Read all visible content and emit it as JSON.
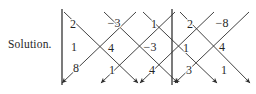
{
  "figure": {
    "label": "Solution.",
    "caption_text": "Solution.",
    "background_color": "#ffffff",
    "ink_color": "#1f1f1f"
  },
  "determinant": {
    "left_bar_label": "|",
    "right_bar_label": "|",
    "rows": [
      [
        "2",
        "−3",
        "1"
      ],
      [
        "1",
        "4",
        "−3"
      ],
      [
        "8",
        "1",
        "4"
      ]
    ],
    "repeated_columns": [
      [
        "2",
        "−8"
      ],
      [
        "1",
        "4"
      ],
      [
        "3",
        "1"
      ]
    ]
  },
  "entries": [
    {
      "name": "entry-r1c1",
      "text": "2",
      "x": 73,
      "y": 24
    },
    {
      "name": "entry-r1c2",
      "text": "−3",
      "x": 114,
      "y": 23
    },
    {
      "name": "entry-r1c3",
      "text": "1",
      "x": 154,
      "y": 24
    },
    {
      "name": "entry-r1c4",
      "text": "2",
      "x": 190,
      "y": 24
    },
    {
      "name": "entry-r1c5",
      "text": "−8",
      "x": 222,
      "y": 23
    },
    {
      "name": "entry-r2c1",
      "text": "1",
      "x": 74,
      "y": 47
    },
    {
      "name": "entry-r2c2",
      "text": "4",
      "x": 111,
      "y": 48
    },
    {
      "name": "entry-r2c3",
      "text": "−3",
      "x": 150,
      "y": 47
    },
    {
      "name": "entry-r2c4",
      "text": "1",
      "x": 186,
      "y": 48
    },
    {
      "name": "entry-r2c5",
      "text": "4",
      "x": 222,
      "y": 47
    },
    {
      "name": "entry-r3c1",
      "text": "8",
      "x": 76,
      "y": 68
    },
    {
      "name": "entry-r3c2",
      "text": "1",
      "x": 112,
      "y": 70
    },
    {
      "name": "entry-r3c3",
      "text": "4",
      "x": 152,
      "y": 70
    },
    {
      "name": "entry-r3c4",
      "text": "3",
      "x": 189,
      "y": 70
    },
    {
      "name": "entry-r3c5",
      "text": "1",
      "x": 224,
      "y": 70
    }
  ],
  "bars": [
    {
      "name": "determinant-bar-left",
      "x": 62,
      "y1": 9,
      "y2": 85
    },
    {
      "name": "determinant-bar-right",
      "x": 172,
      "y1": 9,
      "y2": 85
    }
  ],
  "arrows": {
    "color": "#2a2a2a",
    "stroke_width": 0.9,
    "down_right": [
      {
        "name": "diagonal-arrow-dr-1",
        "x1": 64,
        "y1": 12,
        "x2": 138,
        "y2": 83
      },
      {
        "name": "diagonal-arrow-dr-2",
        "x1": 104,
        "y1": 12,
        "x2": 178,
        "y2": 83
      },
      {
        "name": "diagonal-arrow-dr-3",
        "x1": 143,
        "y1": 12,
        "x2": 217,
        "y2": 83
      },
      {
        "name": "diagonal-arrow-dr-4",
        "x1": 180,
        "y1": 12,
        "x2": 250,
        "y2": 83
      }
    ],
    "down_left": [
      {
        "name": "diagonal-arrow-dl-1",
        "x1": 136,
        "y1": 12,
        "x2": 62,
        "y2": 83
      },
      {
        "name": "diagonal-arrow-dl-2",
        "x1": 175,
        "y1": 12,
        "x2": 101,
        "y2": 83
      },
      {
        "name": "diagonal-arrow-dl-3",
        "x1": 214,
        "y1": 12,
        "x2": 140,
        "y2": 83
      },
      {
        "name": "diagonal-arrow-dl-4",
        "x1": 249,
        "y1": 12,
        "x2": 175,
        "y2": 83
      }
    ]
  }
}
